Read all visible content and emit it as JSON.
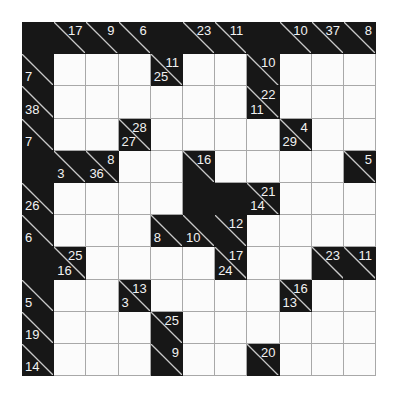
{
  "puzzle": {
    "type": "kakuro",
    "title": "Kakuro Grid",
    "rows": 11,
    "cols": 11,
    "colors": {
      "block": "#171717",
      "open": "#fbfbfb",
      "gridline": "#a8a8a8",
      "slash": "#c9c9c9",
      "clue_text": "#f2f2f2",
      "page_background": "#ffffff"
    },
    "cells": [
      [
        {
          "k": "block"
        },
        {
          "k": "clue",
          "across": "17"
        },
        {
          "k": "clue",
          "across": "9"
        },
        {
          "k": "clue",
          "across": "6"
        },
        {
          "k": "block"
        },
        {
          "k": "clue",
          "across": "23"
        },
        {
          "k": "clue",
          "across": "11"
        },
        {
          "k": "block"
        },
        {
          "k": "clue",
          "across": "10"
        },
        {
          "k": "clue",
          "across": "37"
        },
        {
          "k": "clue",
          "across": "8"
        }
      ],
      [
        {
          "k": "clue",
          "down": "7"
        },
        {
          "k": "open"
        },
        {
          "k": "open"
        },
        {
          "k": "open"
        },
        {
          "k": "clue",
          "across": "11",
          "down": "25"
        },
        {
          "k": "open"
        },
        {
          "k": "open"
        },
        {
          "k": "clue",
          "across": "10"
        },
        {
          "k": "open"
        },
        {
          "k": "open"
        },
        {
          "k": "open"
        }
      ],
      [
        {
          "k": "clue",
          "down": "38"
        },
        {
          "k": "open"
        },
        {
          "k": "open"
        },
        {
          "k": "open"
        },
        {
          "k": "open"
        },
        {
          "k": "open"
        },
        {
          "k": "open"
        },
        {
          "k": "clue",
          "across": "22",
          "down": "11"
        },
        {
          "k": "open"
        },
        {
          "k": "open"
        },
        {
          "k": "open"
        }
      ],
      [
        {
          "k": "clue",
          "down": "7"
        },
        {
          "k": "open"
        },
        {
          "k": "open"
        },
        {
          "k": "clue",
          "across": "28",
          "down": "27"
        },
        {
          "k": "open"
        },
        {
          "k": "open"
        },
        {
          "k": "open"
        },
        {
          "k": "open"
        },
        {
          "k": "clue",
          "across": "4",
          "down": "29"
        },
        {
          "k": "open"
        },
        {
          "k": "open"
        }
      ],
      [
        {
          "k": "block"
        },
        {
          "k": "clue",
          "down": "3"
        },
        {
          "k": "clue",
          "across": "8",
          "down": "36"
        },
        {
          "k": "open"
        },
        {
          "k": "open"
        },
        {
          "k": "clue",
          "across": "16"
        },
        {
          "k": "open"
        },
        {
          "k": "open"
        },
        {
          "k": "open"
        },
        {
          "k": "open"
        },
        {
          "k": "clue",
          "across": "5"
        }
      ],
      [
        {
          "k": "clue",
          "down": "26"
        },
        {
          "k": "open"
        },
        {
          "k": "open"
        },
        {
          "k": "open"
        },
        {
          "k": "open"
        },
        {
          "k": "block"
        },
        {
          "k": "block"
        },
        {
          "k": "clue",
          "across": "21",
          "down": "14"
        },
        {
          "k": "open"
        },
        {
          "k": "open"
        },
        {
          "k": "open"
        }
      ],
      [
        {
          "k": "clue",
          "down": "6"
        },
        {
          "k": "open"
        },
        {
          "k": "open"
        },
        {
          "k": "open"
        },
        {
          "k": "clue",
          "down": "8"
        },
        {
          "k": "clue",
          "down": "10"
        },
        {
          "k": "clue",
          "across": "12"
        },
        {
          "k": "open"
        },
        {
          "k": "open"
        },
        {
          "k": "open"
        },
        {
          "k": "open"
        }
      ],
      [
        {
          "k": "block"
        },
        {
          "k": "clue",
          "across": "25",
          "down": "16"
        },
        {
          "k": "open"
        },
        {
          "k": "open"
        },
        {
          "k": "open"
        },
        {
          "k": "open"
        },
        {
          "k": "clue",
          "across": "17",
          "down": "24"
        },
        {
          "k": "open"
        },
        {
          "k": "open"
        },
        {
          "k": "clue",
          "across": "23"
        },
        {
          "k": "clue",
          "across": "11"
        }
      ],
      [
        {
          "k": "clue",
          "down": "5"
        },
        {
          "k": "open"
        },
        {
          "k": "open"
        },
        {
          "k": "clue",
          "across": "13",
          "down": "3"
        },
        {
          "k": "open"
        },
        {
          "k": "open"
        },
        {
          "k": "open"
        },
        {
          "k": "open"
        },
        {
          "k": "clue",
          "across": "16",
          "down": "13"
        },
        {
          "k": "open"
        },
        {
          "k": "open"
        }
      ],
      [
        {
          "k": "clue",
          "down": "19"
        },
        {
          "k": "open"
        },
        {
          "k": "open"
        },
        {
          "k": "open"
        },
        {
          "k": "clue",
          "across": "25"
        },
        {
          "k": "open"
        },
        {
          "k": "open"
        },
        {
          "k": "open"
        },
        {
          "k": "open"
        },
        {
          "k": "open"
        },
        {
          "k": "open"
        }
      ],
      [
        {
          "k": "clue",
          "down": "14"
        },
        {
          "k": "open"
        },
        {
          "k": "open"
        },
        {
          "k": "open"
        },
        {
          "k": "clue",
          "across": "9"
        },
        {
          "k": "open"
        },
        {
          "k": "open"
        },
        {
          "k": "clue",
          "across": "20"
        },
        {
          "k": "open"
        },
        {
          "k": "open"
        },
        {
          "k": "open"
        }
      ]
    ]
  }
}
